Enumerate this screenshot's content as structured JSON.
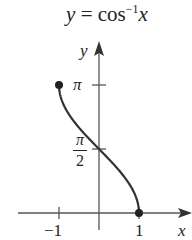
{
  "chart_data": {
    "type": "line",
    "title_parts": {
      "lhs": "y",
      "eq": "=",
      "fn": "cos",
      "exp": "−1",
      "arg": "x"
    },
    "xlabel": "x",
    "ylabel": "y",
    "xlim": [
      -1.5,
      1.6
    ],
    "ylim": [
      0,
      3.5
    ],
    "x_ticks": [
      {
        "value": -1,
        "label": "−1"
      },
      {
        "value": 1,
        "label": "1"
      }
    ],
    "y_ticks": [
      {
        "value": 1.5708,
        "label_num": "π",
        "label_den": "2"
      },
      {
        "value": 3.1416,
        "label": "π"
      }
    ],
    "series": [
      {
        "name": "arccos",
        "x": [
          -1,
          -0.9,
          -0.75,
          -0.5,
          -0.25,
          0,
          0.25,
          0.5,
          0.75,
          0.9,
          1
        ],
        "values": [
          3.1416,
          2.6906,
          2.4189,
          2.0944,
          1.8235,
          1.5708,
          1.3181,
          1.0472,
          0.7227,
          0.451,
          0
        ]
      }
    ],
    "endpoints": [
      {
        "x": -1,
        "y": 3.1416,
        "closed": true
      },
      {
        "x": 1,
        "y": 0,
        "closed": true
      }
    ],
    "grid": false,
    "legend": "none"
  }
}
